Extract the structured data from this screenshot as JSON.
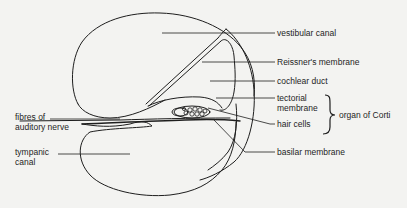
{
  "diagram": {
    "title": "Cross-section of the cochlea",
    "labels": {
      "vestibular_canal": "vestibular canal",
      "reissners_membrane": "Reissner's membrane",
      "cochlear_duct": "cochlear duct",
      "tectorial_membrane_line1": "tectorial",
      "tectorial_membrane_line2": "membrane",
      "organ_of_corti": "organ of Corti",
      "fibres_line1": "fibres of",
      "fibres_line2": "auditory nerve",
      "tympanic_line1": "tympanic",
      "tympanic_line2": "canal",
      "hair_cells": "hair cells",
      "basilar_membrane": "basilar membrane"
    },
    "colors": {
      "background": "#f3f3f1",
      "ink": "#1e1e1e"
    }
  }
}
